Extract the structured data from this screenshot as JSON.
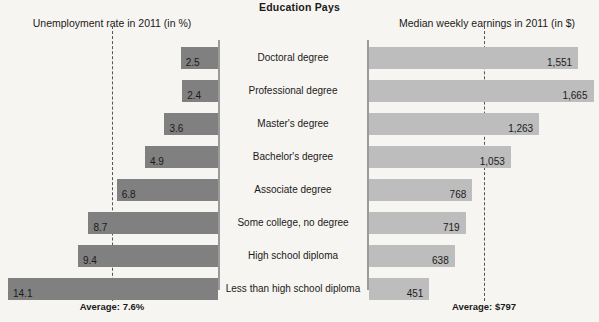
{
  "chart_data": {
    "type": "bar",
    "title": "Education Pays",
    "layout": "diverging-paired-horizontal-bars",
    "categories": [
      "Doctoral degree",
      "Professional degree",
      "Master's degree",
      "Bachelor's degree",
      "Associate degree",
      "Some college, no degree",
      "High school diploma",
      "Less than high school diploma"
    ],
    "panels": [
      {
        "id": "unemployment",
        "title": "Unemployment rate in 2011 (in %)",
        "direction": "right-to-left",
        "unit": "%",
        "values": [
          2.5,
          2.4,
          3.6,
          4.9,
          6.8,
          8.7,
          9.4,
          14.1
        ],
        "value_labels": [
          "2.5",
          "2.4",
          "3.6",
          "4.9",
          "6.8",
          "8.7",
          "9.4",
          "14.1"
        ],
        "bar_color": "#808080",
        "average_value": 7.6,
        "average_label": "Average: 7.6%",
        "axis_max": 14.1
      },
      {
        "id": "earnings",
        "title": "Median weekly earnings in 2011 (in $)",
        "direction": "left-to-right",
        "unit": "$",
        "values": [
          1551,
          1665,
          1263,
          1053,
          768,
          719,
          638,
          451
        ],
        "value_labels": [
          "1,551",
          "1,665",
          "1,263",
          "1,053",
          "768",
          "719",
          "638",
          "451"
        ],
        "bar_color": "#bdbdbd",
        "average_value": 797,
        "average_label": "Average: $797",
        "axis_max": 1665
      }
    ],
    "xlabel": "",
    "ylabel": "",
    "grid": false,
    "legend": "none"
  },
  "colors": {
    "background": "#f7f5f1",
    "left_bar": "#808080",
    "right_bar": "#bdbdbd",
    "axis": "#9a9a9a",
    "dash": "#555555",
    "text": "#1a1a1a"
  }
}
